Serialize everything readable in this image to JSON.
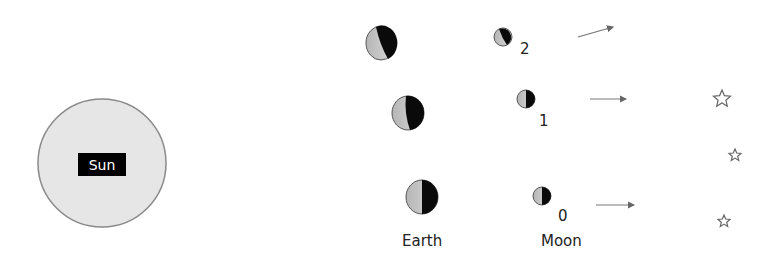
{
  "sun": {
    "label": "Sun",
    "fill": "#e6e6e6",
    "stroke": "#8a8a8a"
  },
  "phases": [
    {
      "index": "2",
      "earth": {
        "cx": 381,
        "cy": 43
      },
      "moon": {
        "cx": 503,
        "cy": 37
      }
    },
    {
      "index": "1",
      "earth": {
        "cx": 408,
        "cy": 113
      },
      "moon": {
        "cx": 526,
        "cy": 99
      }
    },
    {
      "index": "0",
      "earth": {
        "cx": 422,
        "cy": 197
      },
      "moon": {
        "cx": 542,
        "cy": 196
      }
    }
  ],
  "labels": {
    "earth": "Earth",
    "moon": "Moon",
    "moon_index_2": "2",
    "moon_index_1": "1",
    "moon_index_0": "0"
  },
  "colors": {
    "lit": "#c8c8c8",
    "dark": "#0a0a0a",
    "arrow": "#777777",
    "star": "#666666"
  }
}
